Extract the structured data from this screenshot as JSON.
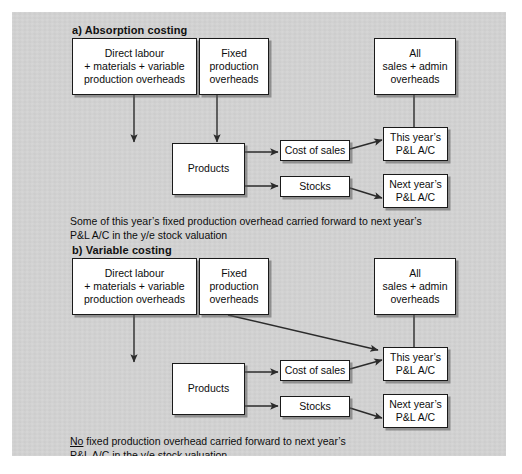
{
  "figure": {
    "background_color": "#d4d4d4",
    "box_fill": "#ffffff",
    "line_color": "#2b2b2b"
  },
  "sections": [
    {
      "id": "a",
      "title": "a) Absorption costing",
      "boxes": {
        "direct_labour": "Direct labour\n+ materials + variable\nproduction overheads",
        "fixed_production": "Fixed\nproduction\noverheads",
        "sales_admin": "All\nsales + admin\noverheads",
        "products": "Products",
        "cost_of_sales": "Cost of sales",
        "stocks": "Stocks",
        "this_year": "This year’s\nP&L A/C",
        "next_year": "Next year’s\nP&L A/C"
      },
      "caption_prefix": "",
      "caption": "Some of this year’s fixed production overhead carried forward to next year’s\nP&L A/C in the y/e stock valuation",
      "flows": [
        "Direct labour + materials + variable production overheads → Products",
        "Fixed production overheads → Products",
        "All sales + admin overheads → This year’s P&L A/C",
        "Products → Cost of sales",
        "Products → Stocks",
        "Cost of sales → This year’s P&L A/C",
        "Stocks → Next year’s P&L A/C"
      ]
    },
    {
      "id": "b",
      "title": "b) Variable costing",
      "boxes": {
        "direct_labour": "Direct labour\n+ materials + variable\nproduction overheads",
        "fixed_production": "Fixed\nproduction\noverheads",
        "sales_admin": "All\nsales + admin\noverheads",
        "products": "Products",
        "cost_of_sales": "Cost of sales",
        "stocks": "Stocks",
        "this_year": "This year’s\nP&L A/C",
        "next_year": "Next year’s\nP&L A/C"
      },
      "caption_prefix": "No",
      "caption": " fixed production overhead carried forward to next year’s\nP&L A/C in the y/e stock valuation",
      "flows": [
        "Direct labour + materials + variable production overheads → Products",
        "Fixed production overheads → This year’s P&L A/C",
        "All sales + admin overheads → This year’s P&L A/C",
        "Products → Cost of sales",
        "Products → Stocks",
        "Cost of sales → This year’s P&L A/C",
        "Stocks → Next year’s P&L A/C"
      ]
    }
  ]
}
